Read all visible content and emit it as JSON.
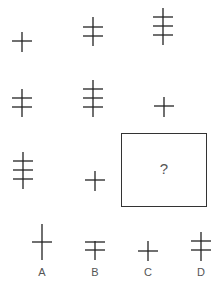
{
  "puzzle": {
    "type": "figure-matrix",
    "rows": 3,
    "cols": 3,
    "stroke_color": "#222222",
    "cells": [
      {
        "row": 1,
        "col": 1,
        "bars": 1
      },
      {
        "row": 1,
        "col": 2,
        "bars": 2
      },
      {
        "row": 1,
        "col": 3,
        "bars": 3
      },
      {
        "row": 2,
        "col": 1,
        "bars": 2
      },
      {
        "row": 2,
        "col": 2,
        "bars": 3
      },
      {
        "row": 2,
        "col": 3,
        "bars": 1
      },
      {
        "row": 3,
        "col": 1,
        "bars": 3
      },
      {
        "row": 3,
        "col": 2,
        "bars": 1
      },
      {
        "row": 3,
        "col": 3,
        "bars": null,
        "placeholder": "?"
      }
    ],
    "question_mark": "?"
  },
  "options": [
    {
      "label": "A",
      "bars": 1,
      "note": "tall vertical, single bar"
    },
    {
      "label": "B",
      "bars": 2,
      "note": "top bar at top of stem"
    },
    {
      "label": "C",
      "bars": 1,
      "note": "short cross"
    },
    {
      "label": "D",
      "bars": 2,
      "note": "two bars"
    }
  ]
}
